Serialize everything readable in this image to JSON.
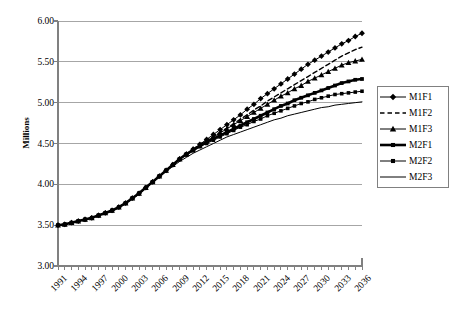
{
  "chart_data": {
    "type": "line",
    "title": "",
    "xlabel": "",
    "ylabel": "Millions",
    "ylim": [
      3.0,
      6.0
    ],
    "ytick_labels": [
      "6.00",
      "5.50",
      "5.00",
      "4.50",
      "4.00",
      "3.50",
      "3.00"
    ],
    "ytick_values": [
      6.0,
      5.5,
      5.0,
      4.5,
      4.0,
      3.5,
      3.0
    ],
    "grid": true,
    "grid_axis": "y",
    "legend_position": "right",
    "x_start": 1991,
    "x_end": 2036,
    "x_tick_interval": 1,
    "x_label_interval": 3,
    "xtick_labels": [
      "1991",
      "1994",
      "1997",
      "2000",
      "2003",
      "2006",
      "2009",
      "2012",
      "2015",
      "2018",
      "2021",
      "2024",
      "2027",
      "2030",
      "2033",
      "2036"
    ],
    "x": [
      1991,
      1992,
      1993,
      1994,
      1995,
      1996,
      1997,
      1998,
      1999,
      2000,
      2001,
      2002,
      2003,
      2004,
      2005,
      2006,
      2007,
      2008,
      2009,
      2010,
      2011,
      2012,
      2013,
      2014,
      2015,
      2016,
      2017,
      2018,
      2019,
      2020,
      2021,
      2022,
      2023,
      2024,
      2025,
      2026,
      2027,
      2028,
      2029,
      2030,
      2031,
      2032,
      2033,
      2034,
      2035,
      2036
    ],
    "series": [
      {
        "name": "M1F1",
        "marker": "diamond",
        "line_style": "solid",
        "line_width": 1,
        "color": "#000000",
        "values": [
          3.5,
          3.51,
          3.53,
          3.55,
          3.57,
          3.59,
          3.62,
          3.65,
          3.68,
          3.72,
          3.77,
          3.83,
          3.89,
          3.96,
          4.03,
          4.1,
          4.17,
          4.24,
          4.31,
          4.37,
          4.43,
          4.49,
          4.55,
          4.61,
          4.67,
          4.73,
          4.79,
          4.85,
          4.92,
          4.98,
          5.05,
          5.11,
          5.17,
          5.23,
          5.29,
          5.35,
          5.41,
          5.47,
          5.52,
          5.57,
          5.62,
          5.67,
          5.72,
          5.76,
          5.81,
          5.85
        ]
      },
      {
        "name": "M1F2",
        "marker": "none",
        "line_style": "dashed",
        "line_width": 1.4,
        "color": "#000000",
        "values": [
          3.5,
          3.51,
          3.53,
          3.55,
          3.57,
          3.59,
          3.62,
          3.65,
          3.68,
          3.72,
          3.77,
          3.83,
          3.89,
          3.96,
          4.03,
          4.1,
          4.17,
          4.24,
          4.31,
          4.37,
          4.43,
          4.49,
          4.54,
          4.59,
          4.64,
          4.69,
          4.74,
          4.8,
          4.85,
          4.91,
          4.96,
          5.02,
          5.07,
          5.12,
          5.17,
          5.22,
          5.27,
          5.32,
          5.37,
          5.42,
          5.47,
          5.52,
          5.57,
          5.61,
          5.65,
          5.68
        ]
      },
      {
        "name": "M1F3",
        "marker": "triangle",
        "line_style": "solid",
        "line_width": 1,
        "color": "#000000",
        "values": [
          3.5,
          3.51,
          3.53,
          3.55,
          3.57,
          3.59,
          3.62,
          3.65,
          3.68,
          3.72,
          3.77,
          3.83,
          3.89,
          3.96,
          4.03,
          4.1,
          4.17,
          4.24,
          4.31,
          4.37,
          4.43,
          4.48,
          4.53,
          4.58,
          4.63,
          4.68,
          4.73,
          4.78,
          4.83,
          4.88,
          4.93,
          4.98,
          5.03,
          5.08,
          5.12,
          5.17,
          5.21,
          5.26,
          5.3,
          5.34,
          5.38,
          5.42,
          5.46,
          5.49,
          5.51,
          5.53
        ]
      },
      {
        "name": "M2F1",
        "marker": "square",
        "line_style": "solid",
        "line_width": 2.6,
        "color": "#000000",
        "values": [
          3.5,
          3.51,
          3.53,
          3.55,
          3.57,
          3.59,
          3.62,
          3.65,
          3.68,
          3.72,
          3.77,
          3.83,
          3.89,
          3.96,
          4.03,
          4.1,
          4.17,
          4.24,
          4.31,
          4.37,
          4.42,
          4.47,
          4.52,
          4.56,
          4.6,
          4.64,
          4.68,
          4.72,
          4.76,
          4.8,
          4.84,
          4.88,
          4.92,
          4.96,
          4.99,
          5.03,
          5.06,
          5.09,
          5.12,
          5.15,
          5.18,
          5.21,
          5.24,
          5.26,
          5.28,
          5.29
        ]
      },
      {
        "name": "M2F2",
        "marker": "square",
        "line_style": "solid",
        "line_width": 1,
        "color": "#000000",
        "values": [
          3.5,
          3.51,
          3.53,
          3.55,
          3.57,
          3.59,
          3.62,
          3.65,
          3.68,
          3.72,
          3.77,
          3.83,
          3.89,
          3.96,
          4.03,
          4.1,
          4.17,
          4.24,
          4.31,
          4.36,
          4.41,
          4.46,
          4.5,
          4.54,
          4.58,
          4.62,
          4.66,
          4.7,
          4.73,
          4.77,
          4.8,
          4.84,
          4.87,
          4.9,
          4.93,
          4.96,
          4.99,
          5.01,
          5.04,
          5.06,
          5.08,
          5.1,
          5.11,
          5.12,
          5.13,
          5.14
        ]
      },
      {
        "name": "M2F3",
        "marker": "none",
        "line_style": "solid",
        "line_width": 1,
        "color": "#000000",
        "values": [
          3.5,
          3.51,
          3.53,
          3.55,
          3.57,
          3.59,
          3.62,
          3.65,
          3.68,
          3.72,
          3.77,
          3.82,
          3.88,
          3.95,
          4.02,
          4.09,
          4.16,
          4.22,
          4.28,
          4.33,
          4.38,
          4.42,
          4.46,
          4.5,
          4.54,
          4.58,
          4.61,
          4.64,
          4.67,
          4.7,
          4.73,
          4.76,
          4.79,
          4.81,
          4.84,
          4.86,
          4.88,
          4.9,
          4.92,
          4.94,
          4.95,
          4.97,
          4.98,
          4.99,
          5.0,
          5.01
        ]
      }
    ]
  },
  "legend": {
    "items": [
      {
        "label": "M1F1",
        "marker": "diamond",
        "line_style": "solid",
        "line_width": 1
      },
      {
        "label": "M1F2",
        "marker": "none",
        "line_style": "dashed",
        "line_width": 1.4
      },
      {
        "label": "M1F3",
        "marker": "triangle",
        "line_style": "solid",
        "line_width": 1
      },
      {
        "label": "M2F1",
        "marker": "square",
        "line_style": "solid",
        "line_width": 2.6
      },
      {
        "label": "M2F2",
        "marker": "square",
        "line_style": "solid",
        "line_width": 1
      },
      {
        "label": "M2F3",
        "marker": "none",
        "line_style": "solid",
        "line_width": 1
      }
    ]
  },
  "colors": {
    "axis": "#808080",
    "grid": "#a6a6a6",
    "series": "#000000",
    "legend_border": "#808080",
    "background": "#ffffff"
  }
}
